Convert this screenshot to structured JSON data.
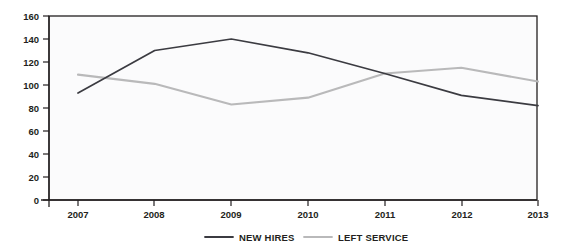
{
  "chart_data": {
    "type": "line",
    "title": "",
    "xlabel": "",
    "ylabel": "",
    "categories": [
      "2007",
      "2008",
      "2009",
      "2010",
      "2011",
      "2012",
      "2013"
    ],
    "x": [
      2007,
      2008,
      2009,
      2010,
      2011,
      2012,
      2013
    ],
    "ylim": [
      0,
      160
    ],
    "yticks": [
      0,
      20,
      40,
      60,
      80,
      100,
      120,
      140,
      160
    ],
    "ytick_labels": [
      "0",
      "20",
      "40",
      "60",
      "80",
      "100",
      "120",
      "140",
      "160"
    ],
    "grid": false,
    "legend_position": "bottom",
    "series": [
      {
        "name": "NEW HIRES",
        "color": "#3b3b41",
        "values": [
          93,
          130,
          140,
          128,
          110,
          91,
          82
        ]
      },
      {
        "name": "LEFT SERVICE",
        "color": "#b9b9ba",
        "values": [
          109,
          101,
          83,
          89,
          110,
          115,
          103
        ]
      }
    ]
  },
  "axes": {
    "y_ticks": [
      {
        "label": "160",
        "value": 160
      },
      {
        "label": "140",
        "value": 140
      },
      {
        "label": "120",
        "value": 120
      },
      {
        "label": "100",
        "value": 100
      },
      {
        "label": "80",
        "value": 80
      },
      {
        "label": "60",
        "value": 60
      },
      {
        "label": "40",
        "value": 40
      },
      {
        "label": "20",
        "value": 20
      },
      {
        "label": "0",
        "value": 0
      }
    ],
    "x_ticks": [
      {
        "label": "2007"
      },
      {
        "label": "2008"
      },
      {
        "label": "2009"
      },
      {
        "label": "2010"
      },
      {
        "label": "2011"
      },
      {
        "label": "2012"
      },
      {
        "label": "2013"
      }
    ]
  },
  "legend": {
    "items": [
      {
        "label": "NEW HIRES",
        "color": "#3b3b41"
      },
      {
        "label": "LEFT SERVICE",
        "color": "#b9b9ba"
      }
    ]
  },
  "colors": {
    "new_hires": "#3b3b41",
    "left_service": "#b9b9ba",
    "axis": "#231f20",
    "plot_background": "#fbfbfc",
    "page_background": "#ffffff"
  }
}
